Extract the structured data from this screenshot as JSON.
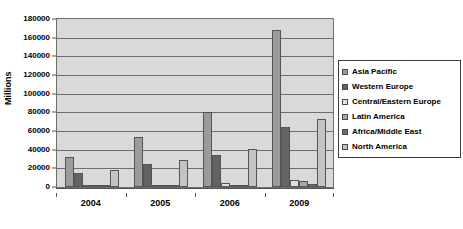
{
  "chart_data": {
    "type": "bar",
    "title": "",
    "xlabel": "",
    "ylabel": "Millions",
    "categories": [
      "2004",
      "2005",
      "2006",
      "2009"
    ],
    "ylim": [
      0,
      180000
    ],
    "ytick_labels": [
      "180000",
      "160000",
      "140000",
      "120000",
      "100000",
      "80000",
      "60000",
      "40000",
      "20000",
      "0"
    ],
    "ytick_values": [
      180000,
      160000,
      140000,
      120000,
      100000,
      80000,
      60000,
      40000,
      20000,
      0
    ],
    "ytick_step": 20000,
    "grid": true,
    "legend_position": "right",
    "series": [
      {
        "name": "Asia Pacific",
        "color": "#9b9b9b",
        "values": [
          32000,
          54000,
          80000,
          168000
        ]
      },
      {
        "name": "Western Europe",
        "color": "#636363",
        "values": [
          15000,
          25000,
          34000,
          64000
        ]
      },
      {
        "name": "Central/Eastern Europe",
        "color": "#e2e2e2",
        "values": [
          2500,
          2000,
          4000,
          8000
        ]
      },
      {
        "name": "Latin America",
        "color": "#a8a8a8",
        "values": [
          1500,
          1000,
          1200,
          6000
        ]
      },
      {
        "name": "Africa/Middle East",
        "color": "#707070",
        "values": [
          700,
          800,
          1000,
          3500
        ]
      },
      {
        "name": "North America",
        "color": "#c4c4c4",
        "values": [
          18000,
          29000,
          41000,
          73000
        ]
      }
    ]
  },
  "legend": {
    "items": [
      {
        "label": "Asia Pacific"
      },
      {
        "label": "Western Europe"
      },
      {
        "label": "Central/Eastern Europe"
      },
      {
        "label": "Latin America"
      },
      {
        "label": "Africa/Middle East"
      },
      {
        "label": "North America"
      }
    ]
  }
}
